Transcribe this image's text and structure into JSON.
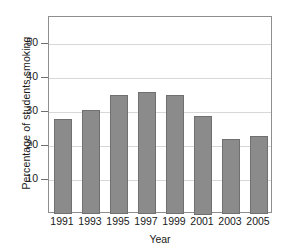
{
  "chart_data": {
    "type": "bar",
    "title": "",
    "xlabel": "Year",
    "ylabel": "Percentage of students smoking",
    "categories": [
      "1991",
      "1993",
      "1995",
      "1997",
      "1999",
      "2001",
      "2003",
      "2005"
    ],
    "values": [
      28,
      30.5,
      35,
      36,
      35,
      29,
      22,
      23
    ],
    "ylim": [
      0,
      58
    ],
    "yticks": [
      10,
      20,
      30,
      40,
      50
    ],
    "ytick_labels": [
      "10",
      "20",
      "30",
      "40",
      "50"
    ],
    "grid": "horizontal",
    "legend": "none",
    "series": [
      {
        "name": "Percentage of students smoking",
        "values": [
          28,
          30.5,
          35,
          36,
          35,
          29,
          22,
          23
        ],
        "color": "#8b8b8b"
      }
    ],
    "colors": {
      "bar_fill": "#8b8b8b",
      "bar_edge": "#707070",
      "gridline": "#d8d8d8",
      "axis": "#8e8e90",
      "background": "#ffffff",
      "text": "#1a1a1a"
    }
  }
}
